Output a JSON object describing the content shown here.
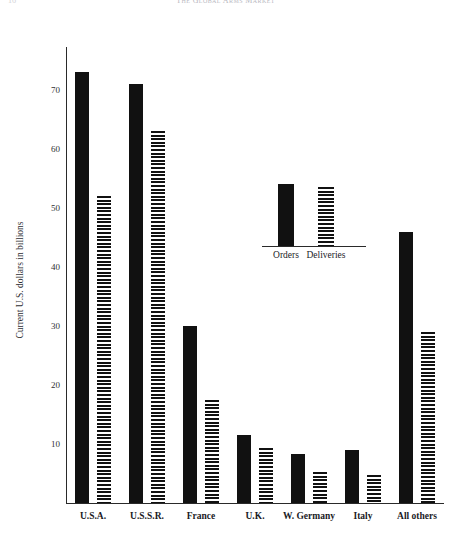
{
  "page": {
    "running_head": "The Global Arms Market",
    "folio": "16"
  },
  "chart_data": {
    "type": "bar",
    "title": "The Global Arms Market",
    "xlabel": "",
    "ylabel": "Current U.S. dollars in billions",
    "ylim": [
      0,
      76
    ],
    "yticks": [
      10,
      20,
      30,
      40,
      50,
      60,
      70
    ],
    "ytick_labels": [
      "10",
      "20",
      "30",
      "40",
      "50",
      "60",
      "70"
    ],
    "grid": false,
    "legend_position": "inside-top-center",
    "categories": [
      "U.S.A.",
      "U.S.S.R.",
      "France",
      "U.K.",
      "W. Germany",
      "Italy",
      "All others"
    ],
    "series": [
      {
        "name": "Orders",
        "fill": "solid-black",
        "color": "#111111",
        "values": [
          73,
          71,
          30,
          11.5,
          8.3,
          9.0,
          46
        ]
      },
      {
        "name": "Deliveries",
        "fill": "horizontal-hatch",
        "color": "#111111",
        "values": [
          52,
          63,
          17.5,
          9.3,
          5.3,
          4.7,
          29
        ]
      }
    ],
    "legend": {
      "entries": [
        {
          "label": "Orders",
          "sample_value": 70
        },
        {
          "label": "Deliveries",
          "sample_value": 67
        }
      ]
    }
  }
}
